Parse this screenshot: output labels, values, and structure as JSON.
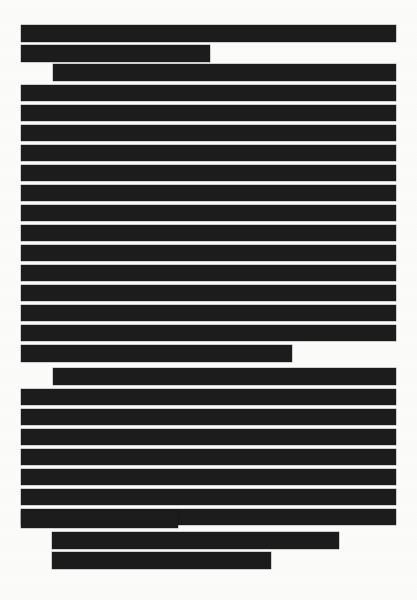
{
  "document": {
    "title": "Redacted Document Page",
    "page_background_color": "#fbfbfa",
    "redaction_color": "#1c1c1c",
    "page_width": 417,
    "page_height": 600,
    "redaction_label": "REDACTED",
    "total_redaction_bars": 30,
    "paragraph_count": 4
  },
  "paragraphs": [
    {
      "id": "paragraph-1",
      "indent_first_line": false,
      "line_count": 2,
      "lines": [
        {
          "id": "line-1",
          "x": 21,
          "y": 25,
          "width": 375,
          "height": 17,
          "full_width": true,
          "label": "REDACTED"
        },
        {
          "id": "line-2",
          "x": 21,
          "y": 45,
          "width": 189,
          "height": 17,
          "full_width": false,
          "label": "REDACTED"
        }
      ]
    },
    {
      "id": "paragraph-2",
      "indent_first_line": true,
      "line_count": 15,
      "lines": [
        {
          "id": "line-3",
          "x": 53,
          "y": 64,
          "width": 343,
          "height": 17,
          "full_width": false,
          "label": "REDACTED"
        },
        {
          "id": "line-4",
          "x": 21,
          "y": 85,
          "width": 375,
          "height": 16,
          "full_width": true,
          "label": "REDACTED"
        },
        {
          "id": "line-5",
          "x": 21,
          "y": 105,
          "width": 375,
          "height": 16,
          "full_width": true,
          "label": "REDACTED"
        },
        {
          "id": "line-6",
          "x": 21,
          "y": 125,
          "width": 375,
          "height": 16,
          "full_width": true,
          "label": "REDACTED"
        },
        {
          "id": "line-7",
          "x": 21,
          "y": 145,
          "width": 375,
          "height": 16,
          "full_width": true,
          "label": "REDACTED"
        },
        {
          "id": "line-8",
          "x": 21,
          "y": 165,
          "width": 375,
          "height": 16,
          "full_width": true,
          "label": "REDACTED"
        },
        {
          "id": "line-9",
          "x": 21,
          "y": 185,
          "width": 375,
          "height": 16,
          "full_width": true,
          "label": "REDACTED"
        },
        {
          "id": "line-10",
          "x": 21,
          "y": 205,
          "width": 375,
          "height": 16,
          "full_width": true,
          "label": "REDACTED"
        },
        {
          "id": "line-11",
          "x": 21,
          "y": 225,
          "width": 375,
          "height": 16,
          "full_width": true,
          "label": "REDACTED"
        },
        {
          "id": "line-12",
          "x": 21,
          "y": 245,
          "width": 375,
          "height": 16,
          "full_width": true,
          "label": "REDACTED"
        },
        {
          "id": "line-13",
          "x": 21,
          "y": 265,
          "width": 375,
          "height": 16,
          "full_width": true,
          "label": "REDACTED"
        },
        {
          "id": "line-14",
          "x": 21,
          "y": 285,
          "width": 375,
          "height": 16,
          "full_width": true,
          "label": "REDACTED"
        },
        {
          "id": "line-15",
          "x": 21,
          "y": 305,
          "width": 375,
          "height": 16,
          "full_width": true,
          "label": "REDACTED"
        },
        {
          "id": "line-16",
          "x": 21,
          "y": 325,
          "width": 375,
          "height": 16,
          "full_width": true,
          "label": "REDACTED"
        },
        {
          "id": "line-17",
          "x": 21,
          "y": 345,
          "width": 271,
          "height": 17,
          "full_width": false,
          "label": "REDACTED"
        }
      ]
    },
    {
      "id": "paragraph-3",
      "indent_first_line": true,
      "line_count": 9,
      "lines": [
        {
          "id": "line-18",
          "x": 53,
          "y": 368,
          "width": 343,
          "height": 17,
          "full_width": false,
          "label": "REDACTED"
        },
        {
          "id": "line-19",
          "x": 21,
          "y": 389,
          "width": 375,
          "height": 16,
          "full_width": true,
          "label": "REDACTED"
        },
        {
          "id": "line-20",
          "x": 21,
          "y": 409,
          "width": 375,
          "height": 16,
          "full_width": true,
          "label": "REDACTED"
        },
        {
          "id": "line-21",
          "x": 21,
          "y": 429,
          "width": 375,
          "height": 16,
          "full_width": true,
          "label": "REDACTED"
        },
        {
          "id": "line-22",
          "x": 21,
          "y": 449,
          "width": 375,
          "height": 16,
          "full_width": true,
          "label": "REDACTED"
        },
        {
          "id": "line-23",
          "x": 21,
          "y": 469,
          "width": 375,
          "height": 16,
          "full_width": true,
          "label": "REDACTED"
        },
        {
          "id": "line-24",
          "x": 21,
          "y": 489,
          "width": 375,
          "height": 16,
          "full_width": true,
          "label": "REDACTED"
        },
        {
          "id": "line-25",
          "x": 21,
          "y": 509,
          "width": 375,
          "height": 16,
          "full_width": true,
          "label": "REDACTED"
        },
        {
          "id": "line-26",
          "x": 21,
          "y": 511,
          "width": 157,
          "height": 17,
          "full_width": false,
          "label": "REDACTED"
        }
      ]
    },
    {
      "id": "paragraph-4",
      "indent_first_line": true,
      "line_count": 2,
      "lines": [
        {
          "id": "line-27",
          "x": 52,
          "y": 532,
          "width": 287,
          "height": 17,
          "full_width": false,
          "label": "REDACTED"
        },
        {
          "id": "line-28",
          "x": 52,
          "y": 552,
          "width": 219,
          "height": 17,
          "full_width": false,
          "label": "REDACTED"
        }
      ]
    }
  ]
}
